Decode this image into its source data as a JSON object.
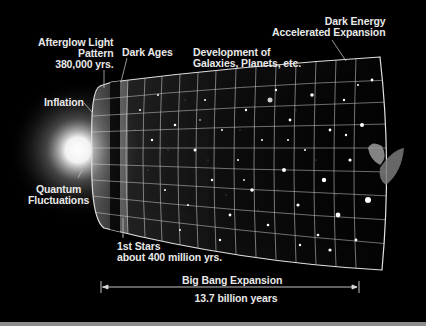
{
  "diagram": {
    "labels": {
      "afterglow": [
        "Afterglow Light",
        "Pattern",
        "380,000 yrs."
      ],
      "dark_ages": "Dark Ages",
      "development": [
        "Development of",
        "Galaxies, Planets, etc."
      ],
      "dark_energy": [
        "Dark Energy",
        "Accelerated Expansion"
      ],
      "inflation": "Inflation",
      "quantum": [
        "Quantum",
        "Fluctuations"
      ],
      "first_stars": [
        "1st Stars",
        "about 400 million yrs."
      ],
      "expansion": "Big Bang Expansion",
      "duration": "13.7 billion years"
    },
    "elements": [
      "bright-origin-glow",
      "expanding-funnel-grid",
      "galaxies-field",
      "satellite"
    ],
    "colors": {
      "background": "#000000",
      "text": "#e8e8e8",
      "grid": "#d8d8d8",
      "bottom_strip": "#8c8c8c"
    }
  }
}
